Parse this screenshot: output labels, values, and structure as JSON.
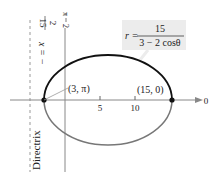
{
  "equation": {
    "lhs": "r =",
    "numerator": "15",
    "denominator": "3 − 2 cosθ"
  },
  "directrix": {
    "label": "Directrix",
    "eq_lhs": "x = −",
    "eq_num": "15",
    "eq_den": "2"
  },
  "axes": {
    "pi_over_2_num": "π",
    "pi_over_2_den": "2",
    "zero_label": "0",
    "ticks": [
      "5",
      "10"
    ]
  },
  "points": [
    {
      "label": "(3, π)"
    },
    {
      "label": "(15, 0)"
    }
  ],
  "colors": {
    "curve_upper": "#111111",
    "curve_lower": "#777777",
    "axis": "#888888",
    "label_bg": "#ececec"
  }
}
